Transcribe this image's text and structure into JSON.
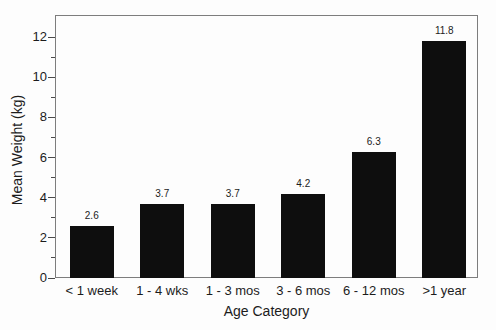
{
  "figure": {
    "background": "#fdfdfd"
  },
  "chart_data": {
    "type": "bar",
    "title": "",
    "categories": [
      "< 1 week",
      "1 - 4 wks",
      "1 - 3 mos",
      "3 - 6 mos",
      "6 - 12 mos",
      ">1 year"
    ],
    "values": [
      2.6,
      3.7,
      3.7,
      4.2,
      6.3,
      11.8
    ],
    "value_labels": [
      "2.6",
      "3.7",
      "3.7",
      "4.2",
      "6.3",
      "11.8"
    ],
    "xlabel": "Age Category",
    "ylabel": "Mean Weight (kg)",
    "ylim": [
      0,
      13.1
    ],
    "yticks_major": [
      0,
      2,
      4,
      6,
      8,
      10,
      12
    ],
    "yticks_minor": [
      1,
      3,
      5,
      7,
      9,
      11
    ],
    "grid": "off",
    "legend": "none",
    "colors": {
      "bar": "#0e0e0e",
      "frame": "#7d7d7d",
      "tick": "#4a4a4a",
      "text": "#1c1c1c"
    }
  }
}
